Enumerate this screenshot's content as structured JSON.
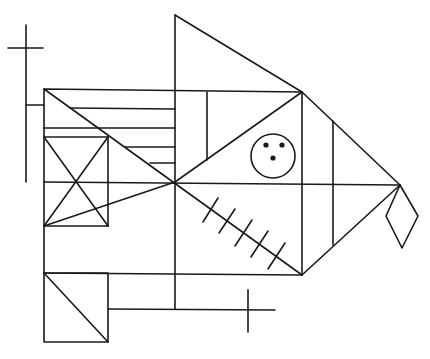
{
  "figure": {
    "stroke_color": "#1a1a1a",
    "background": "#ffffff",
    "elements": [
      {
        "name": "main-rectangle",
        "type": "polygon",
        "points": [
          [
            44,
            89
          ],
          [
            302,
            92
          ],
          [
            302,
            275
          ],
          [
            44,
            273
          ]
        ]
      },
      {
        "name": "top-triangle",
        "type": "polyline",
        "points": [
          [
            175,
            15
          ],
          [
            302,
            92
          ]
        ]
      },
      {
        "name": "top-triangle-left-side",
        "type": "line",
        "points": [
          [
            175,
            15
          ],
          [
            175,
            309
          ]
        ]
      },
      {
        "name": "right-triangle-upper",
        "type": "line",
        "points": [
          [
            302,
            92
          ],
          [
            400,
            185
          ]
        ]
      },
      {
        "name": "right-triangle-lower",
        "type": "line",
        "points": [
          [
            302,
            275
          ],
          [
            400,
            185
          ]
        ]
      },
      {
        "name": "horizontal-midline",
        "type": "line",
        "points": [
          [
            44,
            182
          ],
          [
            400,
            185
          ]
        ]
      },
      {
        "name": "diagonal-main-down",
        "type": "line",
        "points": [
          [
            44,
            89
          ],
          [
            302,
            275
          ]
        ]
      },
      {
        "name": "diagonal-upper-right",
        "type": "line",
        "points": [
          [
            175,
            182
          ],
          [
            302,
            92
          ]
        ]
      },
      {
        "name": "diagonal-lower-left",
        "type": "line",
        "points": [
          [
            44,
            226
          ],
          [
            175,
            182
          ]
        ]
      },
      {
        "name": "left-hline-1",
        "type": "line",
        "points": [
          [
            70,
            108
          ],
          [
            175,
            109
          ]
        ]
      },
      {
        "name": "left-hline-2",
        "type": "line",
        "points": [
          [
            44,
            128
          ],
          [
            175,
            128
          ]
        ]
      },
      {
        "name": "left-hline-3",
        "type": "line",
        "points": [
          [
            44,
            137
          ],
          [
            108,
            137
          ]
        ]
      },
      {
        "name": "left-hline-4",
        "type": "line",
        "points": [
          [
            125,
            147
          ],
          [
            175,
            147
          ]
        ]
      },
      {
        "name": "left-hline-5",
        "type": "line",
        "points": [
          [
            150,
            163
          ],
          [
            175,
            163
          ]
        ]
      },
      {
        "name": "small-square-right",
        "type": "line",
        "points": [
          [
            108,
            137
          ],
          [
            108,
            226
          ]
        ]
      },
      {
        "name": "small-square-bottom",
        "type": "line",
        "points": [
          [
            44,
            226
          ],
          [
            108,
            226
          ]
        ]
      },
      {
        "name": "small-square-x1",
        "type": "line",
        "points": [
          [
            44,
            137
          ],
          [
            108,
            226
          ]
        ]
      },
      {
        "name": "small-square-x2",
        "type": "line",
        "points": [
          [
            108,
            137
          ],
          [
            44,
            226
          ]
        ]
      },
      {
        "name": "upper-inner-vertical",
        "type": "line",
        "points": [
          [
            207,
            92
          ],
          [
            207,
            160
          ]
        ]
      },
      {
        "name": "right-inner-vertical",
        "type": "line",
        "points": [
          [
            333,
            121
          ],
          [
            333,
            245
          ]
        ]
      },
      {
        "name": "lower-left-square",
        "type": "polygon",
        "points": [
          [
            44,
            273
          ],
          [
            108,
            273
          ],
          [
            108,
            342
          ],
          [
            44,
            342
          ]
        ]
      },
      {
        "name": "lower-left-square-diagonal",
        "type": "line",
        "points": [
          [
            44,
            273
          ],
          [
            108,
            342
          ]
        ]
      },
      {
        "name": "lower-ledge",
        "type": "line",
        "points": [
          [
            108,
            309
          ],
          [
            275,
            310
          ]
        ]
      },
      {
        "name": "left-cross-vertical",
        "type": "line",
        "points": [
          [
            26,
            25
          ],
          [
            26,
            182
          ]
        ]
      },
      {
        "name": "left-cross-horizontal",
        "type": "line",
        "points": [
          [
            8,
            48
          ],
          [
            43,
            48
          ]
        ]
      },
      {
        "name": "left-cross-stub",
        "type": "line",
        "points": [
          [
            26,
            105
          ],
          [
            44,
            105
          ]
        ]
      },
      {
        "name": "bottom-cross-vertical",
        "type": "line",
        "points": [
          [
            248,
            290
          ],
          [
            248,
            332
          ]
        ]
      },
      {
        "name": "diamond",
        "type": "polygon",
        "points": [
          [
            400,
            185
          ],
          [
            418,
            216
          ],
          [
            402,
            248
          ],
          [
            386,
            216
          ]
        ]
      },
      {
        "name": "hatch-1",
        "type": "line",
        "points": [
          [
            218,
            198
          ],
          [
            203,
            222
          ]
        ]
      },
      {
        "name": "hatch-2",
        "type": "line",
        "points": [
          [
            235,
            209
          ],
          [
            219,
            233
          ]
        ]
      },
      {
        "name": "hatch-3",
        "type": "line",
        "points": [
          [
            252,
            220
          ],
          [
            235,
            246
          ]
        ]
      },
      {
        "name": "hatch-4",
        "type": "line",
        "points": [
          [
            268,
            231
          ],
          [
            251,
            257
          ]
        ]
      },
      {
        "name": "hatch-5",
        "type": "line",
        "points": [
          [
            285,
            243
          ],
          [
            268,
            269
          ]
        ]
      }
    ],
    "face": {
      "circle": {
        "cx": 273,
        "cy": 156,
        "r": 22
      },
      "dots": [
        {
          "cx": 266,
          "cy": 145,
          "r": 2.6
        },
        {
          "cx": 282,
          "cy": 145,
          "r": 2.6
        },
        {
          "cx": 273,
          "cy": 158,
          "r": 2.6
        }
      ]
    }
  }
}
